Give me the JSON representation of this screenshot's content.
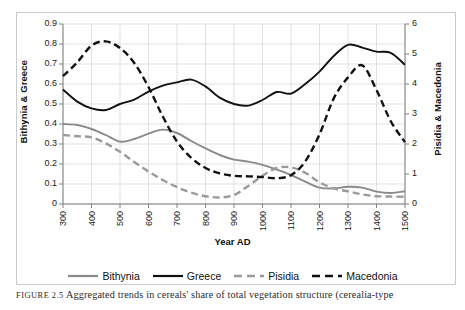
{
  "figure": {
    "caption_label": "FIGURE 2.5",
    "caption_text": "Aggregated trends in cereals' share of total vegetation structure (cerealia-type"
  },
  "chart_data": {
    "type": "line",
    "title": "",
    "xlabel": "Year AD",
    "ylabel": "Bithynia & Greece",
    "y2label": "Pisidia & Macedonia",
    "xlim": [
      300,
      1500
    ],
    "ylim": [
      0,
      0.9
    ],
    "y2lim": [
      0,
      6
    ],
    "grid": true,
    "legend_position": "bottom",
    "xticks": [
      300,
      400,
      500,
      600,
      700,
      800,
      900,
      1000,
      1100,
      1200,
      1300,
      1400,
      1500
    ],
    "xtick_labels": [
      "300",
      "400",
      "500",
      "600",
      "700",
      "800",
      "900",
      "1000",
      "1100",
      "1200",
      "1300",
      "1400",
      "1500"
    ],
    "yticks": [
      0,
      0.1,
      0.2,
      0.3,
      0.4,
      0.5,
      0.6,
      0.7,
      0.8,
      0.9
    ],
    "ytick_labels": [
      "0",
      "0.1",
      "0.2",
      "0.3",
      "0.4",
      "0.5",
      "0.6",
      "0.7",
      "0.8",
      "0.9"
    ],
    "y2ticks": [
      0,
      1,
      2,
      3,
      4,
      5,
      6
    ],
    "y2tick_labels": [
      "0",
      "1",
      "2",
      "3",
      "4",
      "5",
      "6"
    ],
    "x": [
      300,
      350,
      400,
      450,
      500,
      550,
      600,
      650,
      700,
      750,
      800,
      850,
      900,
      950,
      1000,
      1050,
      1100,
      1150,
      1200,
      1250,
      1300,
      1350,
      1400,
      1450,
      1500
    ],
    "series": [
      {
        "name": "Bithynia",
        "axis": "left",
        "color": "#8a8a8a",
        "style": "solid",
        "values": [
          0.4,
          0.395,
          0.375,
          0.345,
          0.312,
          0.325,
          0.352,
          0.372,
          0.355,
          0.315,
          0.278,
          0.245,
          0.222,
          0.212,
          0.196,
          0.172,
          0.145,
          0.112,
          0.082,
          0.078,
          0.086,
          0.082,
          0.062,
          0.055,
          0.064
        ]
      },
      {
        "name": "Greece",
        "axis": "left",
        "color": "#111111",
        "style": "solid",
        "values": [
          0.572,
          0.512,
          0.478,
          0.47,
          0.5,
          0.522,
          0.562,
          0.592,
          0.608,
          0.622,
          0.588,
          0.532,
          0.5,
          0.492,
          0.52,
          0.56,
          0.552,
          0.6,
          0.662,
          0.74,
          0.796,
          0.782,
          0.762,
          0.756,
          0.696
        ]
      },
      {
        "name": "Pisidia",
        "axis": "right",
        "color": "#9a9a9a",
        "style": "dashed",
        "values": [
          2.3,
          2.26,
          2.22,
          2.02,
          1.74,
          1.4,
          1.08,
          0.8,
          0.56,
          0.38,
          0.26,
          0.22,
          0.3,
          0.6,
          0.94,
          1.2,
          1.22,
          1.04,
          0.72,
          0.52,
          0.42,
          0.32,
          0.26,
          0.25,
          0.24
        ]
      },
      {
        "name": "Macedonia",
        "axis": "right",
        "color": "#111111",
        "style": "dashed",
        "values": [
          4.26,
          4.72,
          5.28,
          5.42,
          5.2,
          4.7,
          3.9,
          2.92,
          2.08,
          1.54,
          1.2,
          1.02,
          0.94,
          0.92,
          0.9,
          0.86,
          0.96,
          1.42,
          2.32,
          3.52,
          4.22,
          4.62,
          3.8,
          2.76,
          2.06
        ]
      }
    ]
  },
  "legend": {
    "items": [
      {
        "label": "Bithynia",
        "color": "#8a8a8a",
        "style": "solid"
      },
      {
        "label": "Greece",
        "color": "#111111",
        "style": "solid"
      },
      {
        "label": "Pisidia",
        "color": "#9a9a9a",
        "style": "dashed"
      },
      {
        "label": "Macedonia",
        "color": "#111111",
        "style": "dashed"
      }
    ]
  },
  "colors": {
    "grid": "#d4d4d4",
    "axis": "#808080",
    "background": "#ffffff"
  }
}
